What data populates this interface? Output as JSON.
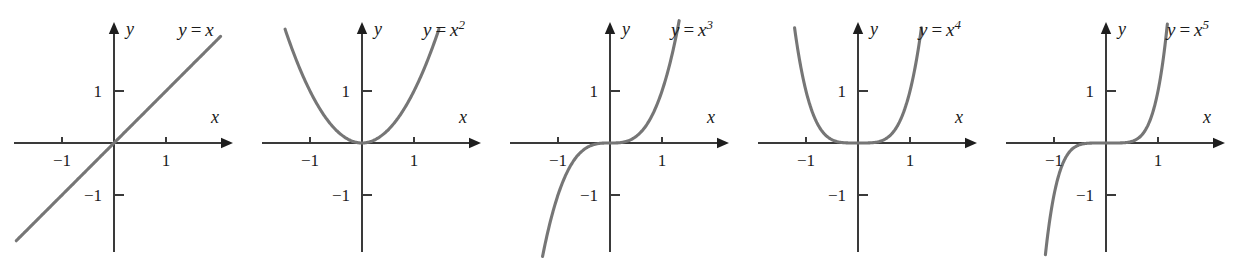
{
  "figure": {
    "background_color": "#ffffff",
    "curve_color": "#767676",
    "axis_color": "#3a3a3a",
    "text_color": "#1a1a1a",
    "panel_count": 5
  },
  "axis": {
    "x_name": "x",
    "y_name": "y",
    "tick_labels": {
      "x_neg_one": "−1",
      "x_pos_one": "1",
      "y_pos_one": "1",
      "y_neg_one": "−1"
    }
  },
  "panels": [
    {
      "id": "panel-y-equals-x",
      "label_prefix": "y",
      "label_equals": "=",
      "label_base": "x",
      "label_exponent": "",
      "label_full": "y = x",
      "exponent_value": 1,
      "ticks_shown": [
        "x=-1",
        "x=1",
        "y=1",
        "y=-1"
      ]
    },
    {
      "id": "panel-y-equals-x-squared",
      "label_prefix": "y",
      "label_equals": "=",
      "label_base": "x",
      "label_exponent": "2",
      "label_full": "y = x²",
      "exponent_value": 2,
      "ticks_shown": [
        "x=-1",
        "x=1",
        "y=1",
        "y=-1"
      ]
    },
    {
      "id": "panel-y-equals-x-cubed",
      "label_prefix": "y",
      "label_equals": "=",
      "label_base": "x",
      "label_exponent": "3",
      "label_full": "y = x³",
      "exponent_value": 3,
      "ticks_shown": [
        "x=-1",
        "x=1",
        "y=1",
        "y=-1"
      ]
    },
    {
      "id": "panel-y-equals-x-fourth",
      "label_prefix": "y",
      "label_equals": "=",
      "label_base": "x",
      "label_exponent": "4",
      "label_full": "y = x⁴",
      "exponent_value": 4,
      "ticks_shown": [
        "x=-1",
        "x=1",
        "y=1",
        "y=-1"
      ]
    },
    {
      "id": "panel-y-equals-x-fifth",
      "label_prefix": "y",
      "label_equals": "=",
      "label_base": "x",
      "label_exponent": "5",
      "label_full": "y = x⁵",
      "exponent_value": 5,
      "ticks_shown": [
        "x=-1",
        "x=1",
        "y=1",
        "y=-1"
      ]
    }
  ],
  "chart_data": [
    {
      "type": "line",
      "title": "y = x",
      "xlabel": "x",
      "ylabel": "y",
      "function": "y = x^1",
      "xlim": [
        -1.9,
        2.2
      ],
      "ylim": [
        -1.9,
        2.2
      ],
      "grid": false,
      "legend": "none",
      "xticks": [
        -1,
        1
      ],
      "yticks": [
        -1,
        1
      ],
      "x_domain_drawn": [
        -1.88,
        2.05
      ],
      "series": [
        {
          "name": "y = x",
          "x": [
            -1.88,
            -1.5,
            -1.0,
            -0.5,
            0.0,
            0.5,
            1.0,
            1.5,
            2.05
          ],
          "y": [
            -1.88,
            -1.5,
            -1.0,
            -0.5,
            0.0,
            0.5,
            1.0,
            1.5,
            2.05
          ]
        }
      ]
    },
    {
      "type": "line",
      "title": "y = x^2",
      "xlabel": "x",
      "ylabel": "y",
      "function": "y = x^2",
      "xlim": [
        -1.9,
        2.2
      ],
      "ylim": [
        -1.9,
        2.2
      ],
      "grid": false,
      "legend": "none",
      "xticks": [
        -1,
        1
      ],
      "yticks": [
        -1,
        1
      ],
      "x_domain_drawn": [
        -1.48,
        1.48
      ],
      "series": [
        {
          "name": "y = x^2",
          "x": [
            -1.48,
            -1.25,
            -1.0,
            -0.75,
            -0.5,
            -0.25,
            0.0,
            0.25,
            0.5,
            0.75,
            1.0,
            1.25,
            1.48
          ],
          "y": [
            2.19,
            1.5625,
            1.0,
            0.5625,
            0.25,
            0.0625,
            0.0,
            0.0625,
            0.25,
            0.5625,
            1.0,
            1.5625,
            2.19
          ]
        }
      ]
    },
    {
      "type": "line",
      "title": "y = x^3",
      "xlabel": "x",
      "ylabel": "y",
      "function": "y = x^3",
      "xlim": [
        -1.9,
        2.2
      ],
      "ylim": [
        -1.9,
        2.2
      ],
      "grid": false,
      "legend": "none",
      "xticks": [
        -1,
        1
      ],
      "yticks": [
        -1,
        1
      ],
      "x_domain_drawn": [
        -1.33,
        1.33
      ],
      "series": [
        {
          "name": "y = x^3",
          "x": [
            -1.33,
            -1.0,
            -0.75,
            -0.5,
            -0.25,
            0.0,
            0.25,
            0.5,
            0.75,
            1.0,
            1.33
          ],
          "y": [
            -2.35,
            -1.0,
            -0.4219,
            -0.125,
            -0.0156,
            0.0,
            0.0156,
            0.125,
            0.4219,
            1.0,
            2.35
          ]
        }
      ]
    },
    {
      "type": "line",
      "title": "y = x^4",
      "xlabel": "x",
      "ylabel": "y",
      "function": "y = x^4",
      "xlim": [
        -1.9,
        2.2
      ],
      "ylim": [
        -1.9,
        2.2
      ],
      "grid": false,
      "legend": "none",
      "xticks": [
        -1,
        1
      ],
      "yticks": [
        -1,
        1
      ],
      "x_domain_drawn": [
        -1.22,
        1.22
      ],
      "series": [
        {
          "name": "y = x^4",
          "x": [
            -1.22,
            -1.0,
            -0.75,
            -0.5,
            -0.25,
            0.0,
            0.25,
            0.5,
            0.75,
            1.0,
            1.22
          ],
          "y": [
            2.216,
            1.0,
            0.3164,
            0.0625,
            0.0039,
            0.0,
            0.0039,
            0.0625,
            0.3164,
            1.0,
            2.216
          ]
        }
      ]
    },
    {
      "type": "line",
      "title": "y = x^5",
      "xlabel": "x",
      "ylabel": "y",
      "function": "y = x^5",
      "xlim": [
        -1.9,
        2.2
      ],
      "ylim": [
        -1.9,
        2.2
      ],
      "grid": false,
      "legend": "none",
      "xticks": [
        -1,
        1
      ],
      "yticks": [
        -1,
        1
      ],
      "x_domain_drawn": [
        -1.18,
        1.18
      ],
      "series": [
        {
          "name": "y = x^5",
          "x": [
            -1.18,
            -1.0,
            -0.75,
            -0.5,
            -0.25,
            0.0,
            0.25,
            0.5,
            0.75,
            1.0,
            1.18
          ],
          "y": [
            -2.288,
            -1.0,
            -0.2373,
            -0.03125,
            -0.00098,
            0.0,
            0.00098,
            0.03125,
            0.2373,
            1.0,
            2.288
          ]
        }
      ]
    }
  ],
  "geometry": {
    "panel_width": 248,
    "panel_height": 268,
    "origin_x": 114,
    "origin_y": 143,
    "unit_px": 52,
    "x_axis_left": 14,
    "x_axis_right": 233,
    "y_axis_top": 22,
    "y_axis_bottom": 252,
    "tick_len": 6
  }
}
